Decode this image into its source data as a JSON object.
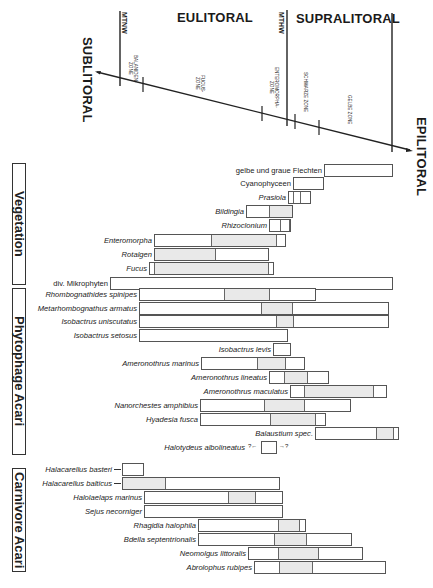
{
  "header": {
    "zones": {
      "eulitoral": "EULITORAL",
      "supralitoral": "SUPRALITORAL",
      "sublitoral": "SUBLITORAL",
      "epilitoral": "EPILITORAL"
    },
    "markers": {
      "mtnw": "MTNW",
      "mthw": "MTHW"
    },
    "subzones": {
      "balaniden": "BALANIDEN-\nZONE",
      "fucus": "FUCUS-\nZONE",
      "enteromorpha": "ENTEROMORPHA-\nZONE",
      "schwarze": "SCHWARZE ZONE",
      "gelbe": "GELBE ZONE"
    }
  },
  "sections": {
    "vegetation": "Vegetation",
    "phytophage": "Phytophage Acari",
    "carnivore": "Carnivore Acari"
  },
  "colors": {
    "line": "#222222",
    "bar_border": "#555555",
    "shade": "#e9e9e9"
  },
  "chart_data": {
    "type": "table",
    "axis": {
      "from": "SUBLITORAL",
      "to": "EPILITORAL",
      "zones": [
        "EULITORAL",
        "SUPRALITORAL"
      ],
      "markers": [
        "MTNW",
        "MTHW"
      ],
      "subzones": [
        "BALANIDEN-ZONE",
        "FUCUS-ZONE",
        "ENTEROMORPHA-ZONE",
        "SCHWARZE ZONE",
        "GELBE ZONE"
      ]
    },
    "groups": [
      {
        "name": "Vegetation",
        "rows": [
          {
            "label": "gelbe und graue Flechten",
            "italic": false,
            "y": 170,
            "segments": [
              [
                324,
                393,
                0
              ]
            ]
          },
          {
            "label": "Cyanophyceen",
            "italic": false,
            "y": 183,
            "segments": [
              [
                293,
                324,
                0
              ]
            ]
          },
          {
            "label": "Prasiola",
            "italic": true,
            "y": 197,
            "segments": [
              [
                288,
                292,
                0
              ],
              [
                292,
                300,
                0
              ],
              [
                300,
                311,
                0
              ]
            ]
          },
          {
            "label": "Bildingia",
            "italic": true,
            "y": 211,
            "segments": [
              [
                246,
                269,
                0
              ],
              [
                269,
                293,
                1
              ]
            ]
          },
          {
            "label": "Rhizoclonium",
            "italic": true,
            "y": 225,
            "segments": [
              [
                269,
                280,
                0
              ],
              [
                280,
                290,
                0
              ],
              [
                290,
                291,
                0
              ]
            ]
          },
          {
            "label": "Enteromorpha",
            "italic": true,
            "y": 240,
            "segments": [
              [
                154,
                211,
                0
              ],
              [
                211,
                277,
                1
              ],
              [
                277,
                286,
                0
              ]
            ]
          },
          {
            "label": "Rotalgen",
            "italic": true,
            "y": 254,
            "segments": [
              [
                154,
                215,
                1
              ],
              [
                215,
                269,
                0
              ]
            ]
          },
          {
            "label": "Fucus",
            "italic": true,
            "y": 268,
            "segments": [
              [
                149,
                153,
                0
              ],
              [
                153,
                269,
                1
              ],
              [
                269,
                274,
                0
              ]
            ]
          },
          {
            "label": "div. Mikrophyten",
            "italic": false,
            "y": 283,
            "segments": [
              [
                110,
                393,
                0
              ]
            ]
          }
        ]
      },
      {
        "name": "Phytophage Acari",
        "rows": [
          {
            "label": "Rhombognathides spinipes",
            "italic": true,
            "y": 294,
            "segments": [
              [
                139,
                224,
                0
              ],
              [
                224,
                269,
                1
              ],
              [
                269,
                316,
                0
              ]
            ]
          },
          {
            "label": "Metarhombognathus armatus",
            "italic": true,
            "y": 308,
            "segments": [
              [
                139,
                261,
                0
              ],
              [
                261,
                292,
                1
              ],
              [
                292,
                389,
                0
              ]
            ]
          },
          {
            "label": "Isobactrus uniscutatus",
            "italic": true,
            "y": 321,
            "segments": [
              [
                139,
                276,
                0
              ],
              [
                276,
                293,
                1
              ],
              [
                293,
                389,
                0
              ]
            ]
          },
          {
            "label": "Isobactrus setosus",
            "italic": true,
            "y": 335,
            "segments": [
              [
                139,
                288,
                0
              ]
            ]
          },
          {
            "label": "Isobactrus levis",
            "italic": true,
            "y": 349,
            "segments": [
              [
                273,
                291,
                0
              ]
            ]
          },
          {
            "label": "Ameronothrus marinus",
            "italic": true,
            "y": 363,
            "segments": [
              [
                201,
                257,
                0
              ],
              [
                257,
                286,
                1
              ],
              [
                286,
                305,
                0
              ]
            ]
          },
          {
            "label": "Ameronothrus lineatus",
            "italic": true,
            "y": 377,
            "segments": [
              [
                269,
                284,
                0
              ],
              [
                284,
                307,
                1
              ],
              [
                307,
                329,
                0
              ]
            ]
          },
          {
            "label": "Ameronothrus maculatus",
            "italic": true,
            "y": 391,
            "segments": [
              [
                290,
                303,
                0
              ],
              [
                303,
                374,
                1
              ],
              [
                374,
                387,
                0
              ]
            ]
          },
          {
            "label": "Nanorchestes amphibius",
            "italic": true,
            "y": 405,
            "segments": [
              [
                200,
                264,
                0
              ],
              [
                264,
                304,
                1
              ],
              [
                304,
                351,
                0
              ]
            ]
          },
          {
            "label": "Hyadesia fusca",
            "italic": true,
            "y": 419,
            "segments": [
              [
                200,
                270,
                0
              ],
              [
                270,
                316,
                1
              ],
              [
                316,
                326,
                0
              ]
            ]
          },
          {
            "label": "Balaustium spec.",
            "italic": true,
            "y": 433,
            "segments": [
              [
                315,
                377,
                0
              ],
              [
                377,
                394,
                1
              ],
              [
                394,
                399,
                0
              ]
            ]
          },
          {
            "label": "Halotydeus albolineatus",
            "italic": true,
            "y": 447,
            "segments": [
              [
                261,
                277,
                0
              ]
            ],
            "open_ends": true
          }
        ]
      },
      {
        "name": "Carnivore Acari",
        "rows": [
          {
            "label": "Halacarellus basteri",
            "italic": true,
            "y": 469,
            "segments": [
              [
                122,
                144,
                0
              ]
            ],
            "left_arrow": true
          },
          {
            "label": "Halacarellus balticus",
            "italic": true,
            "y": 483,
            "segments": [
              [
                122,
                165,
                1
              ],
              [
                165,
                280,
                0
              ]
            ],
            "left_arrow": true
          },
          {
            "label": "Halolaelaps marinus",
            "italic": true,
            "y": 497,
            "segments": [
              [
                144,
                228,
                0
              ],
              [
                228,
                256,
                1
              ],
              [
                256,
                283,
                0
              ]
            ]
          },
          {
            "label": "Sejus necorniger",
            "italic": true,
            "y": 511,
            "segments": [
              [
                144,
                283,
                0
              ]
            ]
          },
          {
            "label": "Rhagidia halophila",
            "italic": true,
            "y": 525,
            "segments": [
              [
                198,
                279,
                0
              ],
              [
                279,
                300,
                1
              ],
              [
                300,
                306,
                0
              ]
            ]
          },
          {
            "label": "Bdella septentrionalis",
            "italic": true,
            "y": 539,
            "segments": [
              [
                198,
                274,
                0
              ],
              [
                274,
                306,
                1
              ],
              [
                306,
                352,
                0
              ]
            ]
          },
          {
            "label": "Neomolgus littoralis",
            "italic": true,
            "y": 553,
            "segments": [
              [
                248,
                278,
                0
              ],
              [
                278,
                318,
                1
              ],
              [
                318,
                363,
                0
              ]
            ]
          },
          {
            "label": "Abrolophus rubipes",
            "italic": true,
            "y": 567,
            "segments": [
              [
                254,
                278,
                0
              ],
              [
                278,
                312,
                1
              ],
              [
                312,
                386,
                0
              ]
            ]
          }
        ]
      }
    ]
  }
}
